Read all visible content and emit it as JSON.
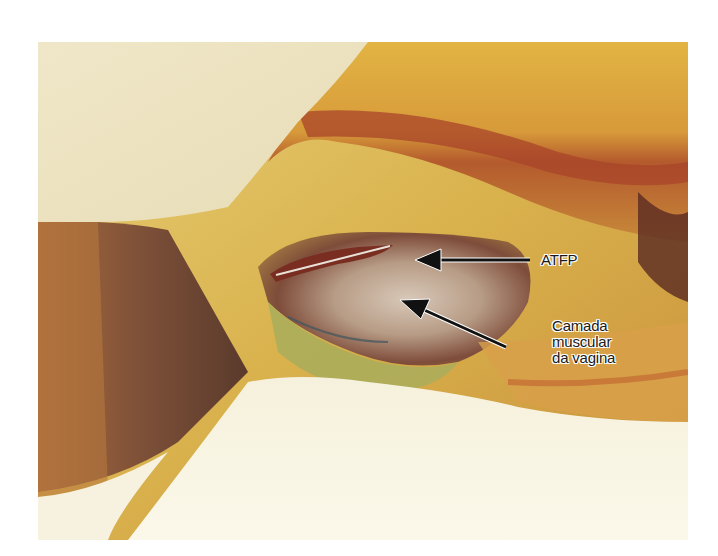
{
  "figure": {
    "annotations": [
      {
        "id": "atfp",
        "text": "ATFP",
        "lines": [
          "ATFP"
        ]
      },
      {
        "id": "camada",
        "text": "Camada muscular da vagina",
        "lines": [
          "Camada",
          "muscular",
          "da vagina"
        ]
      }
    ],
    "colors": {
      "background": "#ffffff",
      "fat_yellow": "#d9b85a",
      "tissue_red": "#b5572f",
      "retractor_brown": "#7a4a34",
      "drape_cream": "#f3edd7",
      "arrow": "#111111"
    }
  }
}
